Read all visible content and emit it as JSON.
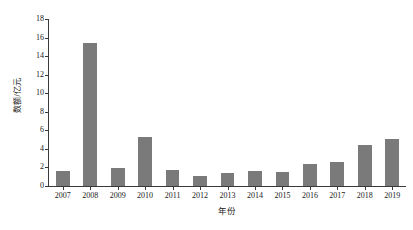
{
  "chart_data": {
    "type": "bar",
    "title": "",
    "subtitle": "",
    "xlabel": "年份",
    "ylabel": "数额/亿元",
    "categories": [
      "2007",
      "2008",
      "2009",
      "2010",
      "2011",
      "2012",
      "2013",
      "2014",
      "2015",
      "2016",
      "2017",
      "2018",
      "2019"
    ],
    "values": [
      1.65,
      15.45,
      1.95,
      5.3,
      1.7,
      1.05,
      1.45,
      1.65,
      1.55,
      2.35,
      2.55,
      4.4,
      5.05
    ],
    "series": [
      {
        "name": "数额",
        "values": [
          1.65,
          15.45,
          1.95,
          5.3,
          1.7,
          1.05,
          1.45,
          1.65,
          1.55,
          2.35,
          2.55,
          4.4,
          5.05
        ]
      }
    ],
    "ylim": [
      0,
      18
    ],
    "ytick_values": [
      0,
      2,
      4,
      6,
      8,
      10,
      12,
      14,
      16,
      18
    ],
    "ytick_labels": [
      "0",
      "2",
      "4",
      "6",
      "8",
      "10",
      "12",
      "14",
      "16",
      "18"
    ],
    "xtick_labels": [
      "2007",
      "2008",
      "2009",
      "2010",
      "2011",
      "2012",
      "2013",
      "2014",
      "2015",
      "2016",
      "2017",
      "2018",
      "2019"
    ],
    "grid": false,
    "legend": false,
    "legend_position": "none",
    "bar_color": "#7a7a7a",
    "axis_color": "#3a3a3a",
    "background_color": "#ffffff",
    "bar_width_ratio": 0.5,
    "spines": [
      "left",
      "bottom"
    ],
    "annotations": []
  }
}
